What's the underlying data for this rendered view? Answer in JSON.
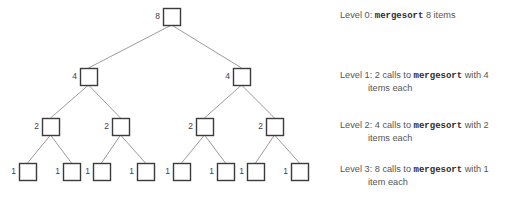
{
  "figure": {
    "width": 514,
    "height": 203,
    "background_color": "#ffffff",
    "box_stroke_color": "#3b3b3b",
    "edge_stroke_color": "#8e8e8e",
    "label_color": "#3f3f3f",
    "legend_color": "#555555",
    "mono_color": "#2e2e2e"
  },
  "tree": {
    "box_size": 17,
    "levels": [
      {
        "level": 0,
        "y": 8,
        "nodes": [
          {
            "label": "8",
            "x": 163
          }
        ]
      },
      {
        "level": 1,
        "y": 68,
        "nodes": [
          {
            "label": "4",
            "x": 80
          },
          {
            "label": "4",
            "x": 233
          }
        ]
      },
      {
        "level": 2,
        "y": 118,
        "nodes": [
          {
            "label": "2",
            "x": 42
          },
          {
            "label": "2",
            "x": 112
          },
          {
            "label": "2",
            "x": 196
          },
          {
            "label": "2",
            "x": 266
          }
        ]
      },
      {
        "level": 3,
        "y": 163,
        "nodes": [
          {
            "label": "1",
            "x": 19
          },
          {
            "label": "1",
            "x": 63
          },
          {
            "label": "1",
            "x": 93
          },
          {
            "label": "1",
            "x": 137
          },
          {
            "label": "1",
            "x": 173
          },
          {
            "label": "1",
            "x": 217
          },
          {
            "label": "1",
            "x": 247
          },
          {
            "label": "1",
            "x": 291
          }
        ]
      }
    ],
    "edges": [
      {
        "from": [
          0,
          0
        ],
        "to": [
          1,
          0
        ]
      },
      {
        "from": [
          0,
          0
        ],
        "to": [
          1,
          1
        ]
      },
      {
        "from": [
          1,
          0
        ],
        "to": [
          2,
          0
        ]
      },
      {
        "from": [
          1,
          0
        ],
        "to": [
          2,
          1
        ]
      },
      {
        "from": [
          1,
          1
        ],
        "to": [
          2,
          2
        ]
      },
      {
        "from": [
          1,
          1
        ],
        "to": [
          2,
          3
        ]
      },
      {
        "from": [
          2,
          0
        ],
        "to": [
          3,
          0
        ]
      },
      {
        "from": [
          2,
          0
        ],
        "to": [
          3,
          1
        ]
      },
      {
        "from": [
          2,
          1
        ],
        "to": [
          3,
          2
        ]
      },
      {
        "from": [
          2,
          1
        ],
        "to": [
          3,
          3
        ]
      },
      {
        "from": [
          2,
          2
        ],
        "to": [
          3,
          4
        ]
      },
      {
        "from": [
          2,
          2
        ],
        "to": [
          3,
          5
        ]
      },
      {
        "from": [
          2,
          3
        ],
        "to": [
          3,
          6
        ]
      },
      {
        "from": [
          2,
          3
        ],
        "to": [
          3,
          7
        ]
      }
    ]
  },
  "legend": {
    "x": 340,
    "indent_x": 368,
    "items": [
      {
        "y": 16,
        "lines": [
          [
            {
              "text": "Level 0: ",
              "mono": false
            },
            {
              "text": "mergesort",
              "mono": true
            },
            {
              "text": " 8 items",
              "mono": false
            }
          ]
        ]
      },
      {
        "y": 76,
        "lines": [
          [
            {
              "text": "Level 1: 2 calls to ",
              "mono": false
            },
            {
              "text": "mergesort",
              "mono": true
            },
            {
              "text": " with 4",
              "mono": false
            }
          ],
          [
            {
              "text": "items each",
              "mono": false,
              "indent": true
            }
          ]
        ]
      },
      {
        "y": 126,
        "lines": [
          [
            {
              "text": "Level 2: 4 calls to ",
              "mono": false
            },
            {
              "text": "mergesort",
              "mono": true
            },
            {
              "text": " with 2",
              "mono": false
            }
          ],
          [
            {
              "text": "items each",
              "mono": false,
              "indent": true
            }
          ]
        ]
      },
      {
        "y": 170,
        "lines": [
          [
            {
              "text": "Level 3: 8 calls to ",
              "mono": false
            },
            {
              "text": "mergesort",
              "mono": true
            },
            {
              "text": " with 1",
              "mono": false
            }
          ],
          [
            {
              "text": "item each",
              "mono": false,
              "indent": true
            }
          ]
        ]
      }
    ]
  }
}
